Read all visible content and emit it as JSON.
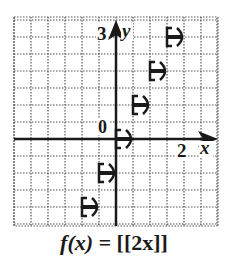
{
  "chart_data": {
    "type": "line",
    "subtype": "step-function",
    "title": "f(x) = [[2x]]",
    "function": "f(x) = [[2x]]",
    "xlabel": "x",
    "ylabel": "y",
    "xlim": [
      -2,
      3
    ],
    "ylim": [
      -2.5,
      3.5
    ],
    "grid": true,
    "grid_step": 0.5,
    "tick_labels": {
      "x": [
        "2"
      ],
      "y": [
        "3"
      ],
      "origin": "0"
    },
    "segments": [
      {
        "y": -2,
        "x_start": -1.0,
        "x_end": -0.5,
        "start_closed": true,
        "end_closed": false
      },
      {
        "y": -1,
        "x_start": -0.5,
        "x_end": 0.0,
        "start_closed": true,
        "end_closed": false
      },
      {
        "y": 0,
        "x_start": 0.0,
        "x_end": 0.5,
        "start_closed": true,
        "end_closed": false
      },
      {
        "y": 1,
        "x_start": 0.5,
        "x_end": 1.0,
        "start_closed": true,
        "end_closed": false
      },
      {
        "y": 2,
        "x_start": 1.0,
        "x_end": 1.5,
        "start_closed": true,
        "end_closed": false
      },
      {
        "y": 3,
        "x_start": 1.5,
        "x_end": 2.0,
        "start_closed": true,
        "end_closed": false
      }
    ],
    "colors": {
      "axis": "#1a1a1a",
      "grid": "#555555",
      "step": "#1a1a1a"
    }
  },
  "labels": {
    "x_axis": "x",
    "y_axis": "y",
    "x_tick": "2",
    "y_tick": "3",
    "origin": "0",
    "caption_lhs": "f(x) = ",
    "caption_rhs": "[[2x]]"
  }
}
